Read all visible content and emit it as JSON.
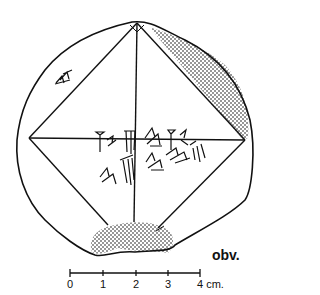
{
  "figure": {
    "side_label": "obv.",
    "scale_bar": {
      "ticks": [
        "0",
        "1",
        "2",
        "3",
        "4 cm."
      ],
      "unit": "cm"
    },
    "colors": {
      "ink": "#111111",
      "background": "#ffffff"
    }
  }
}
